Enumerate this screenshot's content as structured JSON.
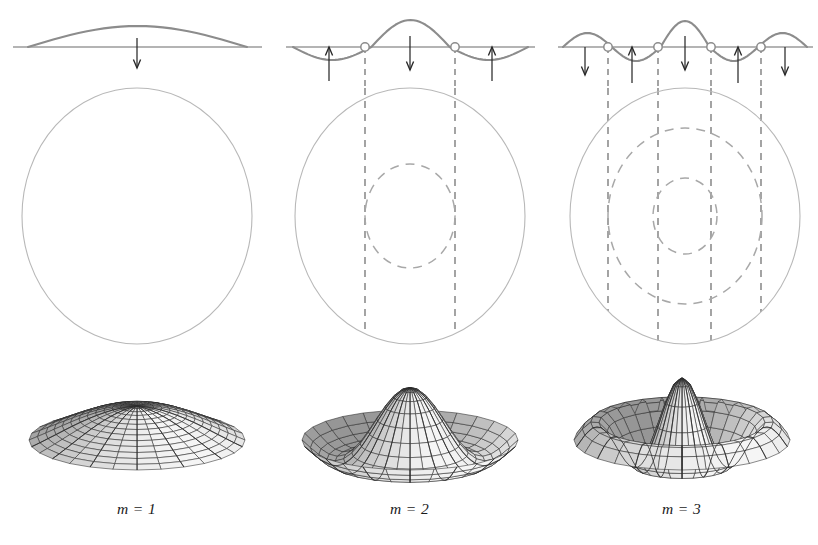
{
  "figure": {
    "background_color": "#ffffff",
    "wave_color": "#8c8c8c",
    "baseline_color": "#6b6b6b",
    "arrow_color": "#2a2a2a",
    "circle_color": "#b8b8b8",
    "nodal_circle_color": "#a8a8a8",
    "dashed_drop_color": "#5a5a5a",
    "node_marker_fill": "#ffffff",
    "node_marker_stroke": "#8c8c8c",
    "mesh_line_color": "#2b2b2b",
    "label_color": "#1a1a1a"
  },
  "columns": [
    {
      "id": "m1",
      "label": "m = 1",
      "mode_number": 1,
      "nodal_circles": 0,
      "interior_nodes": 0,
      "wave": {
        "baseline_y": 47,
        "baseline_x_start": 13,
        "baseline_x_end": 262,
        "curve_x_start": 28,
        "curve_x_end": 247,
        "lobes": [
          {
            "center_x": 137,
            "amplitude": -21,
            "direction": "up"
          }
        ],
        "node_markers_x": [],
        "arrows": [
          {
            "x": 137,
            "direction": "down",
            "length": 30,
            "from_y": 38
          }
        ],
        "drop_lines_x": []
      },
      "circle": {
        "center_x": 137,
        "center_y": 128,
        "radius_x": 115,
        "radius_y": 128,
        "nodal_radii": []
      },
      "surface": {
        "type": "dome",
        "peaks": 1,
        "description": "Single central dome, highest at center, falling smoothly to the rim"
      }
    },
    {
      "id": "m2",
      "label": "m = 2",
      "mode_number": 2,
      "nodal_circles": 1,
      "interior_nodes": 2,
      "wave": {
        "baseline_y": 47,
        "baseline_x_start": 13,
        "baseline_x_end": 262,
        "curve_x_start": 20,
        "curve_x_end": 255,
        "lobes": [
          {
            "center_x": 56,
            "amplitude": 13,
            "direction": "down"
          },
          {
            "center_x": 137,
            "amplitude": -27,
            "direction": "up"
          },
          {
            "center_x": 219,
            "amplitude": 13,
            "direction": "down"
          }
        ],
        "node_markers_x": [
          92,
          182
        ],
        "arrows": [
          {
            "x": 56,
            "direction": "up",
            "length": 34,
            "from_y": 47
          },
          {
            "x": 137,
            "direction": "down",
            "length": 34,
            "from_y": 36
          },
          {
            "x": 219,
            "direction": "up",
            "length": 34,
            "from_y": 47
          }
        ],
        "drop_lines_x": [
          92,
          182
        ]
      },
      "circle": {
        "center_x": 137,
        "center_y": 128,
        "radius_x": 115,
        "radius_y": 128,
        "nodal_radii": [
          {
            "radius_x": 45,
            "radius_y": 52
          }
        ]
      },
      "surface": {
        "type": "peak-with-trough",
        "peaks": 1,
        "description": "Tall central peak encircled by one annular trough and an outer raised rim"
      }
    },
    {
      "id": "m3",
      "label": "m = 3",
      "mode_number": 3,
      "nodal_circles": 2,
      "interior_nodes": 4,
      "wave": {
        "baseline_y": 47,
        "baseline_x_start": 13,
        "baseline_x_end": 268,
        "curve_x_start": 18,
        "curve_x_end": 262,
        "lobes": [
          {
            "center_x": 40,
            "amplitude": -14,
            "direction": "up"
          },
          {
            "center_x": 87,
            "amplitude": 14,
            "direction": "down"
          },
          {
            "center_x": 140,
            "amplitude": -26,
            "direction": "up"
          },
          {
            "center_x": 193,
            "amplitude": 14,
            "direction": "down"
          },
          {
            "center_x": 240,
            "amplitude": -14,
            "direction": "up"
          }
        ],
        "node_markers_x": [
          63,
          113,
          166,
          216
        ],
        "arrows": [
          {
            "x": 40,
            "direction": "down",
            "length": 28,
            "from_y": 47
          },
          {
            "x": 87,
            "direction": "up",
            "length": 36,
            "from_y": 47
          },
          {
            "x": 140,
            "direction": "down",
            "length": 34,
            "from_y": 36
          },
          {
            "x": 193,
            "direction": "up",
            "length": 36,
            "from_y": 47
          },
          {
            "x": 240,
            "direction": "down",
            "length": 28,
            "from_y": 47
          }
        ],
        "drop_lines_x": [
          63,
          113,
          166,
          216
        ]
      },
      "circle": {
        "center_x": 140,
        "center_y": 128,
        "radius_x": 115,
        "radius_y": 128,
        "nodal_radii": [
          {
            "radius_x": 77,
            "radius_y": 88
          },
          {
            "radius_x": 32,
            "radius_y": 38
          }
        ]
      },
      "surface": {
        "type": "sharp-peak-with-deep-trough",
        "peaks": 1,
        "description": "Narrow tall central spike surrounded by a deep annular trough and a broad raised outer ring"
      }
    }
  ]
}
